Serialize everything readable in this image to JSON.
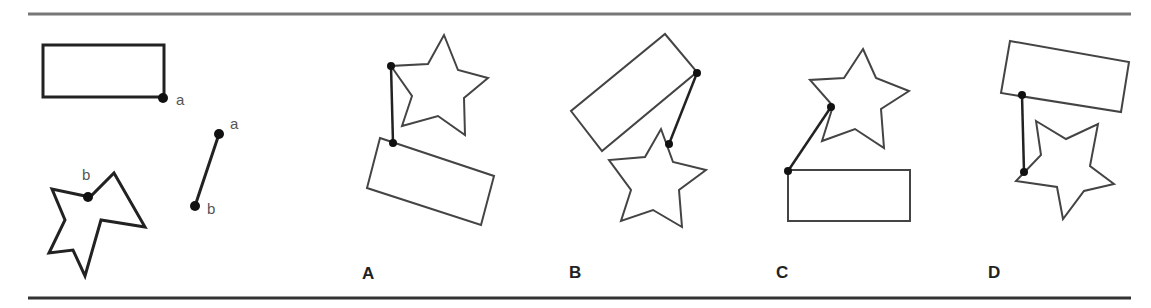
{
  "figure": {
    "type": "mental-rotation-puzzle",
    "example": {
      "rectangle_point_label": "a",
      "star_point_label": "b",
      "connector_top_label": "a",
      "connector_bottom_label": "b"
    },
    "options": [
      {
        "label": "A"
      },
      {
        "label": "B"
      },
      {
        "label": "C"
      },
      {
        "label": "D"
      }
    ]
  }
}
